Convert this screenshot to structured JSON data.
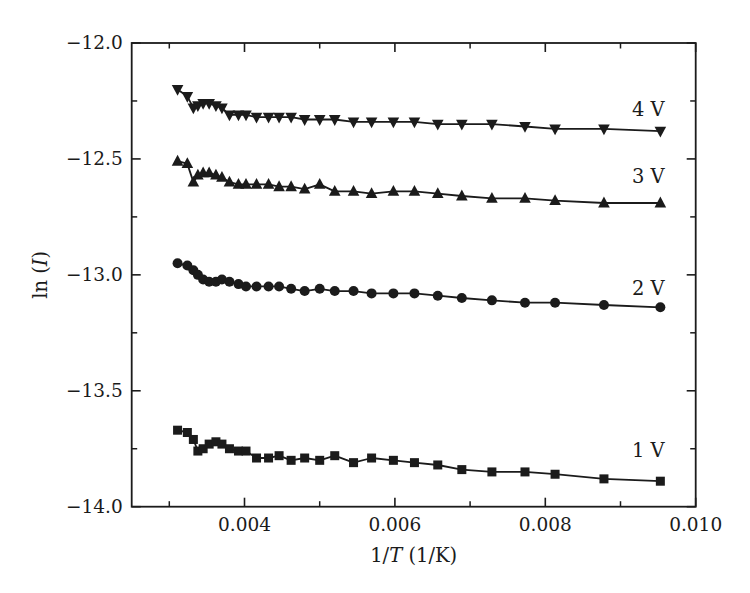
{
  "figure": {
    "background": "#ffffff",
    "ink": "#1b1b1b"
  },
  "chart_data": {
    "type": "line",
    "title": "",
    "xlabel": "1/T (1/K)",
    "ylabel": "ln (I)",
    "xlabel_parts": [
      {
        "t": "1/"
      },
      {
        "t": "T",
        "i": true
      },
      {
        "t": " (1/K)"
      }
    ],
    "ylabel_parts": [
      {
        "t": "ln ("
      },
      {
        "t": "I",
        "i": true
      },
      {
        "t": ")"
      }
    ],
    "xlim": [
      0.0025,
      0.01
    ],
    "ylim": [
      -14.0,
      -12.0
    ],
    "grid": false,
    "legend_position": "inline-right",
    "x_major_ticks": [
      0.004,
      0.006,
      0.008,
      0.01
    ],
    "x_minor_ticks": [
      0.003,
      0.005,
      0.007,
      0.009
    ],
    "x_tick_labels": [
      "0.004",
      "0.006",
      "0.008",
      "0.010"
    ],
    "y_major_ticks": [
      -12.0,
      -12.5,
      -13.0,
      -13.5,
      -14.0
    ],
    "y_minor_ticks": [
      -12.25,
      -12.75,
      -13.25,
      -13.75
    ],
    "y_tick_labels": [
      "−12.0",
      "−12.5",
      "−13.0",
      "−13.5",
      "−14.0"
    ],
    "x": [
      0.00311,
      0.00324,
      0.00332,
      0.00338,
      0.00345,
      0.00353,
      0.00362,
      0.0037,
      0.0038,
      0.00392,
      0.00402,
      0.00416,
      0.00432,
      0.00446,
      0.00462,
      0.0048,
      0.005,
      0.0052,
      0.00545,
      0.00569,
      0.00598,
      0.00626,
      0.00657,
      0.00689,
      0.00729,
      0.00773,
      0.00813,
      0.00878,
      0.00953
    ],
    "series": [
      {
        "name": "4 V",
        "marker": "triangle-down",
        "color": "#1b1b1b",
        "label_x": 0.00937,
        "label_y": -12.29,
        "values": [
          -12.2,
          -12.23,
          -12.28,
          -12.27,
          -12.26,
          -12.26,
          -12.27,
          -12.28,
          -12.31,
          -12.31,
          -12.31,
          -12.32,
          -12.32,
          -12.32,
          -12.32,
          -12.33,
          -12.33,
          -12.33,
          -12.34,
          -12.34,
          -12.34,
          -12.34,
          -12.35,
          -12.35,
          -12.35,
          -12.36,
          -12.37,
          -12.37,
          -12.38
        ]
      },
      {
        "name": "3 V",
        "marker": "triangle-up",
        "color": "#1b1b1b",
        "label_x": 0.00937,
        "label_y": -12.58,
        "values": [
          -12.51,
          -12.52,
          -12.6,
          -12.57,
          -12.56,
          -12.56,
          -12.57,
          -12.58,
          -12.6,
          -12.61,
          -12.61,
          -12.61,
          -12.61,
          -12.62,
          -12.62,
          -12.63,
          -12.61,
          -12.64,
          -12.64,
          -12.65,
          -12.64,
          -12.64,
          -12.65,
          -12.66,
          -12.67,
          -12.67,
          -12.68,
          -12.69,
          -12.69
        ]
      },
      {
        "name": "2 V",
        "marker": "circle",
        "color": "#1b1b1b",
        "label_x": 0.00937,
        "label_y": -13.06,
        "values": [
          -12.95,
          -12.96,
          -12.98,
          -13.0,
          -13.02,
          -13.03,
          -13.03,
          -13.02,
          -13.03,
          -13.04,
          -13.05,
          -13.05,
          -13.05,
          -13.05,
          -13.06,
          -13.07,
          -13.06,
          -13.07,
          -13.07,
          -13.08,
          -13.08,
          -13.08,
          -13.09,
          -13.1,
          -13.11,
          -13.12,
          -13.12,
          -13.13,
          -13.14
        ]
      },
      {
        "name": "1 V",
        "marker": "square",
        "color": "#1b1b1b",
        "label_x": 0.00937,
        "label_y": -13.76,
        "values": [
          -13.67,
          -13.68,
          -13.71,
          -13.76,
          -13.75,
          -13.73,
          -13.72,
          -13.73,
          -13.75,
          -13.76,
          -13.76,
          -13.79,
          -13.79,
          -13.78,
          -13.8,
          -13.79,
          -13.8,
          -13.78,
          -13.81,
          -13.79,
          -13.8,
          -13.81,
          -13.82,
          -13.84,
          -13.85,
          -13.85,
          -13.86,
          -13.88,
          -13.89
        ]
      }
    ]
  }
}
